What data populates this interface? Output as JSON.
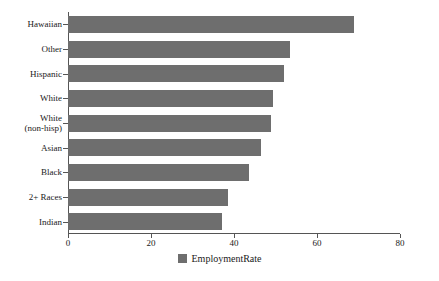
{
  "chart_data": {
    "type": "bar",
    "orientation": "horizontal",
    "title": "",
    "xlabel": "",
    "ylabel": "",
    "categories": [
      "Hawaiian",
      "Other",
      "Hispanic",
      "White",
      "White\n(non-hisp)",
      "Asian",
      "Black",
      "2+ Races",
      "Indian"
    ],
    "values": [
      69,
      53.5,
      52,
      49.5,
      49,
      46.5,
      43.5,
      38.5,
      37
    ],
    "series": [
      {
        "name": "EmploymentRate",
        "values": [
          69,
          53.5,
          52,
          49.5,
          49,
          46.5,
          43.5,
          38.5,
          37
        ],
        "color": "#6e6e6e"
      }
    ],
    "xlim": [
      0,
      80
    ],
    "xticks": [
      0,
      20,
      40,
      60,
      80
    ],
    "xtick_labels": [
      "0",
      "20",
      "40",
      "60",
      "80"
    ],
    "grid": false,
    "legend": {
      "position": "bottom",
      "entries": [
        {
          "label": "EmploymentRate",
          "color": "#6e6e6e"
        }
      ]
    }
  },
  "legend": {
    "label": "EmploymentRate",
    "swatch_name": "legend-color-swatch"
  },
  "axis": {
    "line_color": "#555555"
  }
}
